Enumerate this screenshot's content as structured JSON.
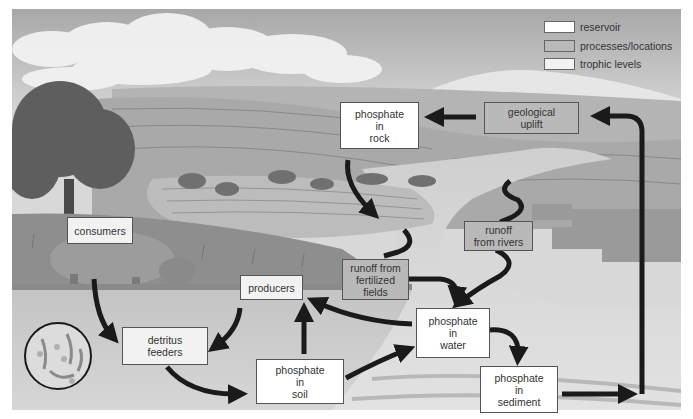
{
  "diagram": {
    "type": "phosphorus cycle illustration",
    "colors": {
      "reservoir": "#ffffff",
      "processes_locations": "#b9b9b9",
      "trophic_levels": "#f2f2f2",
      "arrow": "#1a1a1a"
    },
    "legend": {
      "items": [
        {
          "label": "reservoir",
          "kind": "reservoir"
        },
        {
          "label": "processes/locations",
          "kind": "process"
        },
        {
          "label": "trophic levels",
          "kind": "trophic"
        }
      ]
    },
    "nodes": {
      "phosphate_in_rock": {
        "label": "phosphate\nin\nrock",
        "kind": "reservoir"
      },
      "geological_uplift": {
        "label": "geological\nuplift",
        "kind": "process"
      },
      "runoff_from_rivers": {
        "label": "runoff\nfrom rivers",
        "kind": "process"
      },
      "runoff_from_fertilized_fields": {
        "label": "runoff from\nfertilized\nfields",
        "kind": "process"
      },
      "consumers": {
        "label": "consumers",
        "kind": "trophic"
      },
      "producers": {
        "label": "producers",
        "kind": "trophic"
      },
      "detritus_feeders": {
        "label": "detritus\nfeeders",
        "kind": "trophic"
      },
      "phosphate_in_soil": {
        "label": "phosphate\nin\nsoil",
        "kind": "reservoir"
      },
      "phosphate_in_water": {
        "label": "phosphate\nin\nwater",
        "kind": "reservoir"
      },
      "phosphate_in_sediment": {
        "label": "phosphate\nin\nsediment",
        "kind": "reservoir"
      }
    },
    "edges": [
      {
        "from": "geological_uplift",
        "to": "phosphate_in_rock"
      },
      {
        "from": "phosphate_in_rock",
        "to": "runoff_from_fertilized_fields"
      },
      {
        "from": "phosphate_in_rock",
        "to": "runoff_from_rivers"
      },
      {
        "from": "runoff_from_fertilized_fields",
        "to": "phosphate_in_water"
      },
      {
        "from": "runoff_from_rivers",
        "to": "phosphate_in_water"
      },
      {
        "from": "phosphate_in_water",
        "to": "producers"
      },
      {
        "from": "phosphate_in_water",
        "to": "phosphate_in_sediment"
      },
      {
        "from": "phosphate_in_sediment",
        "to": "geological_uplift"
      },
      {
        "from": "phosphate_in_soil",
        "to": "producers"
      },
      {
        "from": "phosphate_in_soil",
        "to": "phosphate_in_water"
      },
      {
        "from": "producers",
        "to": "detritus_feeders"
      },
      {
        "from": "consumers",
        "to": "detritus_feeders"
      },
      {
        "from": "detritus_feeders",
        "to": "phosphate_in_soil"
      }
    ]
  }
}
